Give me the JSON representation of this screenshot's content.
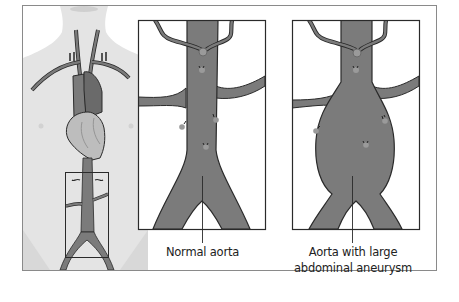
{
  "figure": {
    "type": "medical-illustration",
    "colors": {
      "frame": "#8a8a8a",
      "body": "#e4e4e4",
      "vessel": "#7b7b7b",
      "vessel_dark": "#6a6a6a",
      "outline": "#2a2a2a",
      "heart": "#bdbdbd",
      "panel_bg": "#ffffff",
      "text": "#222222"
    }
  },
  "panels": {
    "overview": {
      "name": "Torso with aorta and highlighted abdominal region"
    },
    "normal": {
      "label": "Normal aorta"
    },
    "aneurysm": {
      "label_line1": "Aorta with large",
      "label_line2": "abdominal aneurysm"
    }
  }
}
